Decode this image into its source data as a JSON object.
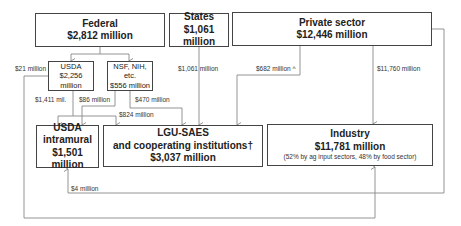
{
  "nodes": {
    "federal": {
      "title": "Federal",
      "value": "$2,812 million"
    },
    "states": {
      "title": "States",
      "value": "$1,061 million"
    },
    "private": {
      "title": "Private sector",
      "value": "$12,446 million"
    },
    "usda": {
      "title": "USDA",
      "value": "$2,256 million"
    },
    "nsf": {
      "title": "NSF, NIH, etc.",
      "value": "$556 million"
    },
    "usda_intramural": {
      "title": "USDA",
      "subtitle": "intramural",
      "value": "$1,501 million"
    },
    "lgu": {
      "title": "LGU-SAES",
      "subtitle": "and cooperating institutions†",
      "value": "$3,037 million"
    },
    "industry": {
      "title": "Industry",
      "value": "$11,781 million",
      "note": "(52% by ag input sectors, 48% by food sector)"
    }
  },
  "flows": {
    "usda_to_industry": "$21 million",
    "usda_to_intramural": "$1,411 mil.",
    "nsf_to_intramural": "$86 million",
    "usda_to_lgu": "$824 million",
    "nsf_to_lgu": "$470 million",
    "states_to_lgu": "$1,061 million",
    "private_to_lgu": "$682 million ^",
    "private_to_industry": "$11,760 million",
    "private_to_intramural": "$4 million"
  },
  "colors": {
    "line": "#777777",
    "border": "#444444"
  }
}
